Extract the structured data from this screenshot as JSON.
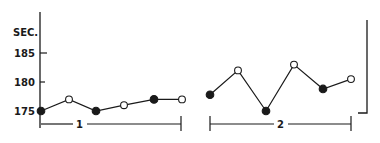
{
  "chart_data": {
    "type": "line",
    "title": "",
    "xlabel": "",
    "ylabel": "SEC.",
    "yticks": [
      175,
      180,
      185
    ],
    "ylim": [
      174,
      190
    ],
    "grid": false,
    "legend": null,
    "groups": [
      {
        "label": "1",
        "points": [
          {
            "index": 1,
            "value": 175.0,
            "marker": "filled"
          },
          {
            "index": 2,
            "value": 177.0,
            "marker": "open"
          },
          {
            "index": 3,
            "value": 175.0,
            "marker": "filled"
          },
          {
            "index": 4,
            "value": 176.0,
            "marker": "open"
          },
          {
            "index": 5,
            "value": 177.0,
            "marker": "filled"
          },
          {
            "index": 6,
            "value": 177.0,
            "marker": "open"
          }
        ]
      },
      {
        "label": "2",
        "points": [
          {
            "index": 1,
            "value": 177.8,
            "marker": "filled"
          },
          {
            "index": 2,
            "value": 182.0,
            "marker": "open"
          },
          {
            "index": 3,
            "value": 175.0,
            "marker": "filled"
          },
          {
            "index": 4,
            "value": 183.0,
            "marker": "open"
          },
          {
            "index": 5,
            "value": 178.8,
            "marker": "filled"
          },
          {
            "index": 6,
            "value": 180.5,
            "marker": "open"
          }
        ]
      }
    ]
  },
  "axis": {
    "unit_label": "SEC.",
    "tick_labels": [
      "185",
      "180",
      "175"
    ]
  },
  "group_labels": [
    "1",
    "2"
  ],
  "colors": {
    "ink": "#1a1a1a",
    "background": "#ffffff"
  }
}
